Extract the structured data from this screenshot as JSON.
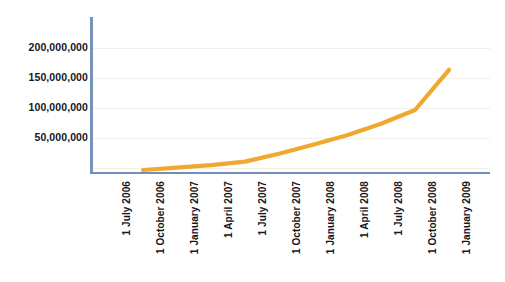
{
  "chart_data": {
    "type": "line",
    "title": "",
    "subtitle": "",
    "xlabel": "",
    "ylabel": "",
    "grid": true,
    "legend": false,
    "legend_position": "none",
    "line_color": "#f0a830",
    "axis_color": "#6f8fbc",
    "gridline_color": "#f2efe4",
    "label_color": "#14161c",
    "ylim": [
      0,
      220000000
    ],
    "y_ticks": [
      50000000,
      100000000,
      150000000,
      200000000
    ],
    "y_tick_labels": [
      "50,000,000",
      "100,000,000",
      "150,000,000",
      "200,000,000"
    ],
    "categories": [
      "1 July 2006",
      "1 October 2006",
      "1 January 2007",
      "1 April 2007",
      "1 July 2007",
      "1 October 2007",
      "1 January 2008",
      "1 April 2008",
      "1 July 2008",
      "1 October 2008",
      "1 January 2009"
    ],
    "series": [
      {
        "name": "Total",
        "values": [
          null,
          5000000,
          9000000,
          13000000,
          19000000,
          32000000,
          47000000,
          63000000,
          82000000,
          105000000,
          172000000
        ]
      }
    ]
  }
}
